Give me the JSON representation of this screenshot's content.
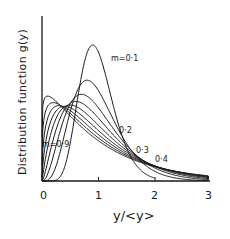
{
  "chart_data": {
    "type": "line",
    "title": "",
    "xlabel": "y/<y>",
    "ylabel": "Distribution function g(y)",
    "xlim": [
      0,
      3
    ],
    "x_ticks": [
      "0",
      "1",
      "2",
      "3"
    ],
    "y_ticks": [],
    "grid": false,
    "legend": "none (inline annotations)",
    "series": [
      {
        "name": "m=0.1",
        "m": 0.1,
        "peak_x": 1.0,
        "annotation": "m=0·1"
      },
      {
        "name": "m=0.2",
        "m": 0.2,
        "peak_x": 0.95,
        "annotation": "0·2"
      },
      {
        "name": "m=0.3",
        "m": 0.3,
        "peak_x": 0.85,
        "annotation": "0·3"
      },
      {
        "name": "m=0.4",
        "m": 0.4,
        "peak_x": 0.75,
        "annotation": "0·4"
      },
      {
        "name": "m=0.5",
        "m": 0.5,
        "peak_x": 0.6,
        "annotation": ""
      },
      {
        "name": "m=0.6",
        "m": 0.6,
        "peak_x": 0.5,
        "annotation": ""
      },
      {
        "name": "m=0.7",
        "m": 0.7,
        "peak_x": 0.35,
        "annotation": ""
      },
      {
        "name": "m=0.8",
        "m": 0.8,
        "peak_x": 0.2,
        "annotation": ""
      },
      {
        "name": "m=0.9",
        "m": 0.9,
        "peak_x": 0.1,
        "annotation": "m=0·9"
      }
    ]
  },
  "labels": {
    "x_axis_title": "y/<y>",
    "y_axis_title": "Distribution function  g(y)",
    "ann_m01": "m=0·1",
    "ann_02": "0·2",
    "ann_03": "0·3",
    "ann_04": "0·4",
    "ann_m09": "m=0·9",
    "tick0": "0",
    "tick1": "1",
    "tick2": "2",
    "tick3": "3"
  }
}
